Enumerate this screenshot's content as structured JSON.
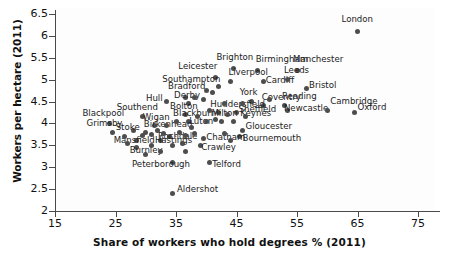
{
  "chart_data": {
    "type": "scatter",
    "title": "",
    "xlabel": "Share of workers who hold degrees % (2011)",
    "ylabel": "Workers per hectare (2011)",
    "xlim": [
      15,
      79
    ],
    "ylim": [
      2,
      6.5
    ],
    "xticks": [
      "15",
      "25",
      "35",
      "45",
      "55",
      "65",
      "75"
    ],
    "yticks": [
      "6.5",
      "6",
      "5.5",
      "5",
      "4.5",
      "4",
      "3.5",
      "3",
      "2.5",
      "2"
    ],
    "grid": false,
    "legend": "none",
    "point_color": "#4d4d4d",
    "points": [
      {
        "label": "London",
        "x": 65.0,
        "y": 6.1,
        "lx": -16,
        "ly": -13
      },
      {
        "label": "Brighton",
        "x": 44.5,
        "y": 5.25,
        "lx": -17,
        "ly": -12
      },
      {
        "label": "Birmingham",
        "x": 48.5,
        "y": 5.2,
        "lx": -2,
        "ly": -12
      },
      {
        "label": "Manchester",
        "x": 55.0,
        "y": 5.2,
        "lx": -4,
        "ly": -12
      },
      {
        "label": "Leicester",
        "x": 41.5,
        "y": 5.05,
        "lx": -37,
        "ly": -11
      },
      {
        "label": "Liverpool",
        "x": 44.0,
        "y": 4.95,
        "lx": -2,
        "ly": -10
      },
      {
        "label": "Cardiff",
        "x": 49.5,
        "y": 4.95,
        "lx": 2,
        "ly": -2
      },
      {
        "label": "Leeds",
        "x": 53.5,
        "y": 5.0,
        "lx": -4,
        "ly": -10
      },
      {
        "label": "Bristol",
        "x": 56.5,
        "y": 4.8,
        "lx": 3,
        "ly": -3
      },
      {
        "label": "Southampton",
        "x": 40.0,
        "y": 4.75,
        "lx": -44,
        "ly": -12
      },
      {
        "label": "Hull",
        "x": 33.5,
        "y": 4.5,
        "lx": -21,
        "ly": -4
      },
      {
        "label": "Bradford",
        "x": 36.5,
        "y": 4.6,
        "lx": -17,
        "ly": -11
      },
      {
        "label": "Derby",
        "x": 37.0,
        "y": 4.45,
        "lx": -14,
        "ly": -9
      },
      {
        "label": "York",
        "x": 47.5,
        "y": 4.5,
        "lx": -12,
        "ly": -10
      },
      {
        "label": "Coventry",
        "x": 49.5,
        "y": 4.4,
        "lx": -2,
        "ly": -9
      },
      {
        "label": "Reading",
        "x": 53.0,
        "y": 4.4,
        "lx": -3,
        "ly": -10
      },
      {
        "label": "Newcastle",
        "x": 53.5,
        "y": 4.3,
        "lx": -4,
        "ly": -2
      },
      {
        "label": "Cambridge",
        "x": 60.0,
        "y": 4.3,
        "lx": 3,
        "ly": -9
      },
      {
        "label": "Oxford",
        "x": 64.5,
        "y": 4.25,
        "lx": 3,
        "ly": -6
      },
      {
        "label": "Bolton",
        "x": 36.5,
        "y": 4.2,
        "lx": -15,
        "ly": -9
      },
      {
        "label": "Huddersfield",
        "x": 42.0,
        "y": 4.25,
        "lx": -8,
        "ly": -9
      },
      {
        "label": "Sheffield",
        "x": 45.0,
        "y": 4.25,
        "lx": 2,
        "ly": -4
      },
      {
        "label": "Southend",
        "x": 29.5,
        "y": 4.15,
        "lx": -26,
        "ly": -10
      },
      {
        "label": "Blackpool",
        "x": 24.0,
        "y": 4.0,
        "lx": -27,
        "ly": -10
      },
      {
        "label": "Blackburn",
        "x": 37.0,
        "y": 4.05,
        "lx": -15,
        "ly": -8
      },
      {
        "label": "Milton Keynes",
        "x": 42.5,
        "y": 4.05,
        "lx": -10,
        "ly": -8
      },
      {
        "label": "Wigan",
        "x": 31.5,
        "y": 3.95,
        "lx": -12,
        "ly": -9
      },
      {
        "label": "Grimsby",
        "x": 24.5,
        "y": 3.8,
        "lx": -26,
        "ly": -9
      },
      {
        "label": "Stoke",
        "x": 28.0,
        "y": 3.85,
        "lx": -18,
        "ly": -3
      },
      {
        "label": "Birkenhead",
        "x": 32.0,
        "y": 3.85,
        "lx": -14,
        "ly": -6
      },
      {
        "label": "Luton",
        "x": 37.5,
        "y": 3.9,
        "lx": -2,
        "ly": -7
      },
      {
        "label": "Gloucester",
        "x": 46.0,
        "y": 3.85,
        "lx": 3,
        "ly": -4
      },
      {
        "label": "Bournemouth",
        "x": 45.5,
        "y": 3.7,
        "lx": 3,
        "ly": 1
      },
      {
        "label": "Rochdale",
        "x": 34.0,
        "y": 3.7,
        "lx": -12,
        "ly": -1
      },
      {
        "label": "Mansfield",
        "x": 28.5,
        "y": 3.6,
        "lx": -23,
        "ly": -1
      },
      {
        "label": "Hastings",
        "x": 32.5,
        "y": 3.6,
        "lx": -6,
        "ly": -1
      },
      {
        "label": "Chatham",
        "x": 39.5,
        "y": 3.65,
        "lx": 3,
        "ly": -2
      },
      {
        "label": "Crawley",
        "x": 39.0,
        "y": 3.5,
        "lx": 1,
        "ly": 2
      },
      {
        "label": "Burnley",
        "x": 28.5,
        "y": 3.45,
        "lx": -7,
        "ly": 2
      },
      {
        "label": "Peterborough",
        "x": 34.5,
        "y": 3.1,
        "lx": -41,
        "ly": 1
      },
      {
        "label": "Telford",
        "x": 40.5,
        "y": 3.1,
        "lx": 3,
        "ly": 1
      },
      {
        "label": "Aldershot",
        "x": 34.5,
        "y": 2.4,
        "lx": 4,
        "ly": -4
      },
      {
        "label": "",
        "x": 38.0,
        "y": 4.6,
        "lx": 0,
        "ly": 0
      },
      {
        "label": "",
        "x": 39.5,
        "y": 4.55,
        "lx": 0,
        "ly": 0
      },
      {
        "label": "",
        "x": 41.0,
        "y": 4.7,
        "lx": 0,
        "ly": 0
      },
      {
        "label": "",
        "x": 43.0,
        "y": 4.45,
        "lx": 0,
        "ly": 0
      },
      {
        "label": "",
        "x": 46.0,
        "y": 4.45,
        "lx": 0,
        "ly": 0
      },
      {
        "label": "",
        "x": 40.5,
        "y": 4.3,
        "lx": 0,
        "ly": 0
      },
      {
        "label": "",
        "x": 43.5,
        "y": 4.2,
        "lx": 0,
        "ly": 0
      },
      {
        "label": "",
        "x": 38.5,
        "y": 4.15,
        "lx": 0,
        "ly": 0
      },
      {
        "label": "",
        "x": 40.0,
        "y": 4.05,
        "lx": 0,
        "ly": 0
      },
      {
        "label": "",
        "x": 41.5,
        "y": 4.1,
        "lx": 0,
        "ly": 0
      },
      {
        "label": "",
        "x": 35.0,
        "y": 4.05,
        "lx": 0,
        "ly": 0
      },
      {
        "label": "",
        "x": 33.5,
        "y": 3.95,
        "lx": 0,
        "ly": 0
      },
      {
        "label": "",
        "x": 30.0,
        "y": 3.8,
        "lx": 0,
        "ly": 0
      },
      {
        "label": "",
        "x": 31.0,
        "y": 3.75,
        "lx": 0,
        "ly": 0
      },
      {
        "label": "",
        "x": 33.0,
        "y": 3.78,
        "lx": 0,
        "ly": 0
      },
      {
        "label": "",
        "x": 35.5,
        "y": 3.8,
        "lx": 0,
        "ly": 0
      },
      {
        "label": "",
        "x": 36.5,
        "y": 3.72,
        "lx": 0,
        "ly": 0
      },
      {
        "label": "",
        "x": 38.0,
        "y": 3.78,
        "lx": 0,
        "ly": 0
      },
      {
        "label": "",
        "x": 43.0,
        "y": 3.78,
        "lx": 0,
        "ly": 0
      },
      {
        "label": "",
        "x": 44.0,
        "y": 3.6,
        "lx": 0,
        "ly": 0
      },
      {
        "label": "",
        "x": 36.0,
        "y": 3.55,
        "lx": 0,
        "ly": 0
      },
      {
        "label": "",
        "x": 34.5,
        "y": 3.5,
        "lx": 0,
        "ly": 0
      },
      {
        "label": "",
        "x": 31.0,
        "y": 3.5,
        "lx": 0,
        "ly": 0
      },
      {
        "label": "",
        "x": 29.5,
        "y": 3.72,
        "lx": 0,
        "ly": 0
      },
      {
        "label": "",
        "x": 26.5,
        "y": 3.7,
        "lx": 0,
        "ly": 0
      },
      {
        "label": "",
        "x": 27.0,
        "y": 3.55,
        "lx": 0,
        "ly": 0
      },
      {
        "label": "",
        "x": 32.5,
        "y": 3.35,
        "lx": 0,
        "ly": 0
      },
      {
        "label": "",
        "x": 30.0,
        "y": 3.3,
        "lx": 0,
        "ly": 0
      },
      {
        "label": "",
        "x": 36.5,
        "y": 3.35,
        "lx": 0,
        "ly": 0
      },
      {
        "label": "",
        "x": 44.5,
        "y": 4.05,
        "lx": 0,
        "ly": 0
      },
      {
        "label": "",
        "x": 46.5,
        "y": 4.15,
        "lx": 0,
        "ly": 0
      },
      {
        "label": "",
        "x": 50.5,
        "y": 4.55,
        "lx": 0,
        "ly": 0
      },
      {
        "label": "",
        "x": 42.0,
        "y": 4.85,
        "lx": 0,
        "ly": 0
      }
    ]
  }
}
